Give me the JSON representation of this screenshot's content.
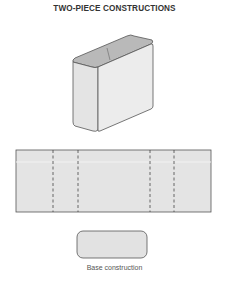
{
  "title": "TWO-PIECE CONSTRUCTIONS",
  "figures": {
    "box": {
      "label": "assembled two-piece box",
      "front_color": "#e6e6e6",
      "top_color": "#b3b3b3",
      "side_color": "#dcdcdc"
    },
    "flat_piece": {
      "label": "flat body piece with fold lines",
      "fold_lines": 4,
      "fill": "#e3e3e3"
    },
    "base": {
      "label": "base piece",
      "fill": "#e3e3e3"
    }
  },
  "caption": "Base construction",
  "colors": {
    "stroke": "#555555",
    "text": "#333333"
  }
}
